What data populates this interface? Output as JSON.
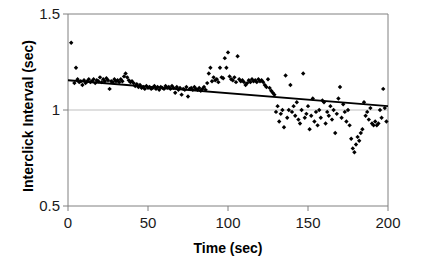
{
  "chart_data": {
    "type": "scatter",
    "title": "",
    "xlabel": "Time (sec)",
    "ylabel": "Interclick Interval (sec)",
    "xlim": [
      0,
      200
    ],
    "ylim": [
      0.5,
      1.5
    ],
    "xticks": [
      0,
      50,
      100,
      150,
      200
    ],
    "yticks": [
      0.5,
      1,
      1.5
    ],
    "xtick_labels": [
      "0",
      "50",
      "100",
      "150",
      "200"
    ],
    "ytick_labels": [
      "0.5",
      "1",
      "1.5"
    ],
    "grid": "horizontal-gridline-at-1.0",
    "legend": "none",
    "marker": "filled-diamond",
    "marker_color": "#000000",
    "trendline": {
      "type": "linear",
      "color": "#000000",
      "x_start": 0,
      "y_start": 1.155,
      "x_end": 200,
      "y_end": 1.02
    },
    "series": [
      {
        "name": "Interclick interval",
        "points": [
          [
            2,
            1.35
          ],
          [
            5,
            1.22
          ],
          [
            4,
            1.14
          ],
          [
            6,
            1.16
          ],
          [
            7,
            1.145
          ],
          [
            8,
            1.15
          ],
          [
            9,
            1.13
          ],
          [
            10,
            1.155
          ],
          [
            11,
            1.14
          ],
          [
            12,
            1.15
          ],
          [
            13,
            1.16
          ],
          [
            14,
            1.145
          ],
          [
            15,
            1.15
          ],
          [
            16,
            1.16
          ],
          [
            17,
            1.14
          ],
          [
            18,
            1.155
          ],
          [
            19,
            1.15
          ],
          [
            20,
            1.17
          ],
          [
            21,
            1.145
          ],
          [
            22,
            1.16
          ],
          [
            23,
            1.15
          ],
          [
            24,
            1.165
          ],
          [
            25,
            1.155
          ],
          [
            26,
            1.11
          ],
          [
            27,
            1.15
          ],
          [
            28,
            1.145
          ],
          [
            29,
            1.16
          ],
          [
            30,
            1.15
          ],
          [
            31,
            1.155
          ],
          [
            32,
            1.145
          ],
          [
            33,
            1.16
          ],
          [
            34,
            1.15
          ],
          [
            35,
            1.175
          ],
          [
            36,
            1.19
          ],
          [
            37,
            1.17
          ],
          [
            38,
            1.155
          ],
          [
            39,
            1.145
          ],
          [
            40,
            1.15
          ],
          [
            41,
            1.14
          ],
          [
            42,
            1.125
          ],
          [
            43,
            1.135
          ],
          [
            44,
            1.12
          ],
          [
            45,
            1.13
          ],
          [
            46,
            1.115
          ],
          [
            47,
            1.12
          ],
          [
            48,
            1.11
          ],
          [
            49,
            1.125
          ],
          [
            50,
            1.115
          ],
          [
            51,
            1.12
          ],
          [
            52,
            1.11
          ],
          [
            53,
            1.115
          ],
          [
            54,
            1.125
          ],
          [
            55,
            1.11
          ],
          [
            56,
            1.12
          ],
          [
            57,
            1.105
          ],
          [
            58,
            1.12
          ],
          [
            59,
            1.115
          ],
          [
            60,
            1.11
          ],
          [
            61,
            1.125
          ],
          [
            62,
            1.115
          ],
          [
            63,
            1.12
          ],
          [
            64,
            1.11
          ],
          [
            65,
            1.125
          ],
          [
            66,
            1.115
          ],
          [
            67,
            1.09
          ],
          [
            68,
            1.12
          ],
          [
            69,
            1.105
          ],
          [
            70,
            1.115
          ],
          [
            71,
            1.08
          ],
          [
            72,
            1.11
          ],
          [
            73,
            1.105
          ],
          [
            74,
            1.12
          ],
          [
            75,
            1.07
          ],
          [
            76,
            1.11
          ],
          [
            77,
            1.115
          ],
          [
            78,
            1.105
          ],
          [
            79,
            1.12
          ],
          [
            80,
            1.11
          ],
          [
            81,
            1.105
          ],
          [
            82,
            1.115
          ],
          [
            83,
            1.1
          ],
          [
            84,
            1.11
          ],
          [
            85,
            1.12
          ],
          [
            86,
            1.105
          ],
          [
            87,
            1.14
          ],
          [
            88,
            1.19
          ],
          [
            89,
            1.22
          ],
          [
            90,
            1.15
          ],
          [
            91,
            1.17
          ],
          [
            92,
            1.155
          ],
          [
            93,
            1.16
          ],
          [
            94,
            1.145
          ],
          [
            95,
            1.22
          ],
          [
            96,
            1.17
          ],
          [
            97,
            1.165
          ],
          [
            98,
            1.27
          ],
          [
            99,
            1.22
          ],
          [
            100,
            1.3
          ],
          [
            101,
            1.175
          ],
          [
            102,
            1.16
          ],
          [
            103,
            1.155
          ],
          [
            104,
            1.17
          ],
          [
            105,
            1.145
          ],
          [
            106,
            1.28
          ],
          [
            107,
            1.16
          ],
          [
            108,
            1.15
          ],
          [
            109,
            1.155
          ],
          [
            110,
            1.145
          ],
          [
            111,
            1.13
          ],
          [
            112,
            1.14
          ],
          [
            113,
            1.155
          ],
          [
            114,
            1.145
          ],
          [
            115,
            1.16
          ],
          [
            116,
            1.15
          ],
          [
            117,
            1.155
          ],
          [
            118,
            1.145
          ],
          [
            119,
            1.16
          ],
          [
            120,
            1.15
          ],
          [
            121,
            1.155
          ],
          [
            122,
            1.145
          ],
          [
            123,
            1.13
          ],
          [
            124,
            1.12
          ],
          [
            125,
            1.16
          ],
          [
            126,
            1.115
          ],
          [
            127,
            1.1
          ],
          [
            128,
            1.09
          ],
          [
            129,
            1.08
          ],
          [
            130,
            0.99
          ],
          [
            131,
            1.02
          ],
          [
            132,
            0.94
          ],
          [
            133,
            0.98
          ],
          [
            134,
            1.0
          ],
          [
            135,
            0.91
          ],
          [
            136,
            1.18
          ],
          [
            137,
            0.96
          ],
          [
            138,
            1.0
          ],
          [
            139,
            1.13
          ],
          [
            140,
            0.99
          ],
          [
            141,
            1.02
          ],
          [
            142,
            0.97
          ],
          [
            143,
            1.04
          ],
          [
            144,
            0.95
          ],
          [
            145,
            0.93
          ],
          [
            146,
            1.0
          ],
          [
            147,
            1.19
          ],
          [
            148,
            0.96
          ],
          [
            149,
            0.98
          ],
          [
            150,
            1.02
          ],
          [
            151,
            0.9
          ],
          [
            152,
            0.97
          ],
          [
            153,
            1.06
          ],
          [
            154,
            0.94
          ],
          [
            155,
            0.99
          ],
          [
            156,
            0.92
          ],
          [
            157,
            1.0
          ],
          [
            158,
            0.96
          ],
          [
            159,
            1.05
          ],
          [
            160,
            1.04
          ],
          [
            161,
            0.93
          ],
          [
            162,
            0.99
          ],
          [
            163,
            0.97
          ],
          [
            164,
            1.02
          ],
          [
            165,
            0.95
          ],
          [
            166,
            1.0
          ],
          [
            167,
            0.88
          ],
          [
            168,
            0.98
          ],
          [
            169,
            1.06
          ],
          [
            170,
            1.12
          ],
          [
            171,
            0.96
          ],
          [
            172,
            1.03
          ],
          [
            173,
            0.99
          ],
          [
            174,
            0.94
          ],
          [
            175,
            1.0
          ],
          [
            176,
            0.92
          ],
          [
            177,
            0.85
          ],
          [
            178,
            0.8
          ],
          [
            179,
            0.78
          ],
          [
            180,
            0.82
          ],
          [
            181,
            0.86
          ],
          [
            182,
            0.84
          ],
          [
            183,
            0.88
          ],
          [
            184,
            0.9
          ],
          [
            185,
            1.04
          ],
          [
            186,
            0.97
          ],
          [
            187,
            0.99
          ],
          [
            188,
            0.95
          ],
          [
            189,
            1.01
          ],
          [
            190,
            0.93
          ],
          [
            191,
            0.92
          ],
          [
            192,
            0.94
          ],
          [
            193,
            0.92
          ],
          [
            194,
            0.93
          ],
          [
            195,
            1.0
          ],
          [
            196,
            0.96
          ],
          [
            197,
            1.11
          ],
          [
            198,
            1.01
          ],
          [
            199,
            0.94
          ]
        ]
      }
    ]
  },
  "axes": {
    "y_title": "Interclick Interval (sec)",
    "x_title": "Time (sec)",
    "y_labels": [
      "1.5",
      "1",
      "0.5"
    ],
    "x_labels": [
      "0",
      "50",
      "100",
      "150",
      "200"
    ]
  },
  "colors": {
    "marker": "#000000",
    "trendline": "#000000",
    "axis": "#808080",
    "gridline": "#bfbfbf",
    "text": "#000000",
    "background": "#ffffff"
  }
}
